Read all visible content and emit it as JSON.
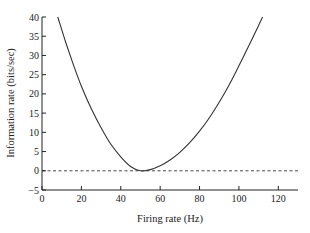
{
  "chart_data": {
    "type": "line",
    "title": "",
    "xlabel": "Firing rate (Hz)",
    "ylabel": "Information rate (bits/sec)",
    "xlim": [
      0,
      130
    ],
    "ylim": [
      -5,
      40
    ],
    "xticks": [
      0,
      20,
      40,
      60,
      80,
      100,
      120
    ],
    "yticks": [
      -5,
      0,
      5,
      10,
      15,
      20,
      25,
      30,
      35,
      40
    ],
    "grid": false,
    "legend": null,
    "series": [
      {
        "name": "information rate",
        "style": "solid",
        "x": [
          8,
          12,
          16,
          20,
          25,
          30,
          35,
          40,
          45,
          50,
          55,
          60,
          65,
          70,
          75,
          80,
          85,
          90,
          95,
          100,
          105,
          110,
          112
        ],
        "y": [
          40,
          33.5,
          27.5,
          22,
          16.2,
          11.2,
          6.9,
          3.6,
          1.1,
          0,
          0.3,
          1.3,
          2.8,
          4.8,
          7.3,
          10.3,
          13.8,
          17.8,
          22.3,
          27.3,
          32.5,
          37.8,
          40
        ]
      },
      {
        "name": "zero baseline",
        "style": "dashed",
        "x": [
          0,
          130
        ],
        "y": [
          0,
          0
        ]
      }
    ]
  }
}
